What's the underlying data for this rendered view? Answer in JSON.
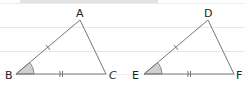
{
  "figure": {
    "colors": {
      "background": "#ffffff",
      "top_bar": "#e2e2e2",
      "rule_line": "#e8e8e8",
      "stroke": "#777777",
      "angle_fill": "#cfcfcf",
      "label": "#222222"
    },
    "triangles": [
      {
        "name": "ABC",
        "vertices": {
          "A": [
            80,
            20
          ],
          "B": [
            16,
            74
          ],
          "C": [
            106,
            74
          ]
        },
        "labels": {
          "A": "A",
          "B": "B",
          "C": "C"
        },
        "marked_angle": "B",
        "single_tick_side": "AB",
        "double_tick_side": "BC"
      },
      {
        "name": "DEF",
        "vertices": {
          "D": [
            208,
            20
          ],
          "E": [
            144,
            74
          ],
          "F": [
            234,
            74
          ]
        },
        "labels": {
          "D": "D",
          "E": "E",
          "F": "F"
        },
        "marked_angle": "E",
        "single_tick_side": "DE",
        "double_tick_side": "EF"
      }
    ]
  }
}
